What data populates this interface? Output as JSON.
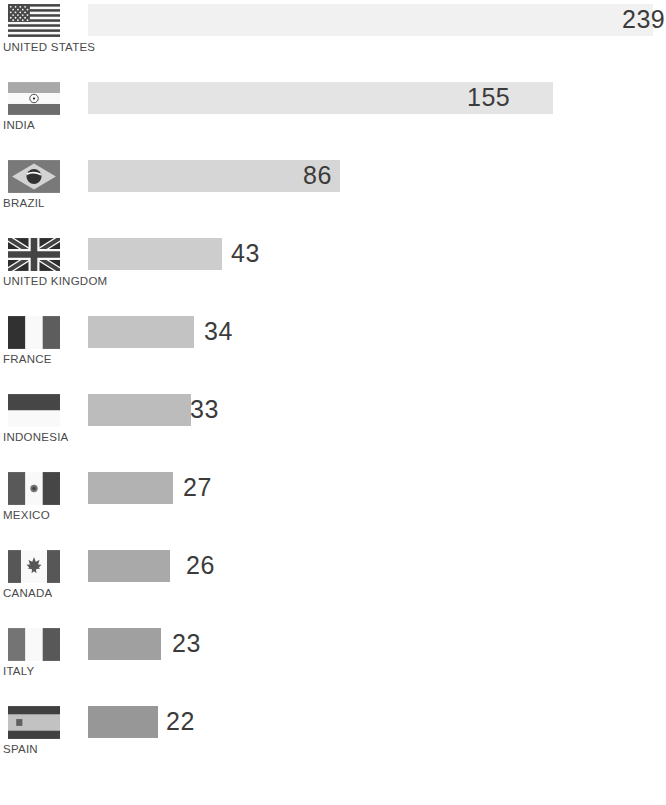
{
  "chart_data": {
    "type": "bar",
    "orientation": "horizontal",
    "title": "",
    "subtitle": "",
    "xlabel": "",
    "ylabel": "",
    "grid": false,
    "legend": false,
    "axis_visible": false,
    "xlim": [
      0,
      239
    ],
    "categories": [
      "UNITED STATES",
      "INDIA",
      "BRAZIL",
      "UNITED KINGDOM",
      "FRANCE",
      "INDONESIA",
      "MEXICO",
      "CANADA",
      "ITALY",
      "SPAIN"
    ],
    "values": [
      239,
      155,
      86,
      43,
      34,
      33,
      27,
      26,
      23,
      22
    ],
    "value_labels": [
      "239",
      "155",
      "86",
      "43",
      "34",
      "33",
      "27",
      "26",
      "23",
      "22"
    ],
    "bar_colors": [
      "#f1f1f1",
      "#e4e4e4",
      "#d6d6d6",
      "#cdcdcd",
      "#c3c3c3",
      "#bcbcbc",
      "#b2b2b2",
      "#a9a9a9",
      "#a0a0a0",
      "#979797"
    ]
  },
  "rows": [
    {
      "country": "UNITED STATES",
      "value": "239",
      "flag_icon": "flag-united-states-icon",
      "bar_width_px": 565,
      "bar_color": "#f1f1f1",
      "label_left_px": 622,
      "row_top_px": 2
    },
    {
      "country": "INDIA",
      "value": "155",
      "flag_icon": "flag-india-icon",
      "bar_width_px": 465,
      "bar_color": "#e4e4e4",
      "label_left_px": 467,
      "row_top_px": 80
    },
    {
      "country": "BRAZIL",
      "value": "86",
      "flag_icon": "flag-brazil-icon",
      "bar_width_px": 252,
      "bar_color": "#d6d6d6",
      "label_left_px": 303,
      "row_top_px": 158
    },
    {
      "country": "UNITED KINGDOM",
      "value": "43",
      "flag_icon": "flag-united-kingdom-icon",
      "bar_width_px": 134,
      "bar_color": "#cdcdcd",
      "label_left_px": 231,
      "row_top_px": 236
    },
    {
      "country": "FRANCE",
      "value": "34",
      "flag_icon": "flag-france-icon",
      "bar_width_px": 106,
      "bar_color": "#c3c3c3",
      "label_left_px": 204,
      "row_top_px": 314
    },
    {
      "country": "INDONESIA",
      "value": "33",
      "flag_icon": "flag-indonesia-icon",
      "bar_width_px": 103,
      "bar_color": "#bcbcbc",
      "label_left_px": 190,
      "row_top_px": 392
    },
    {
      "country": "MEXICO",
      "value": "27",
      "flag_icon": "flag-mexico-icon",
      "bar_width_px": 85,
      "bar_color": "#b2b2b2",
      "label_left_px": 183,
      "row_top_px": 470
    },
    {
      "country": "CANADA",
      "value": "26",
      "flag_icon": "flag-canada-icon",
      "bar_width_px": 82,
      "bar_color": "#a9a9a9",
      "label_left_px": 186,
      "row_top_px": 548
    },
    {
      "country": "ITALY",
      "value": "23",
      "flag_icon": "flag-italy-icon",
      "bar_width_px": 73,
      "bar_color": "#a0a0a0",
      "label_left_px": 172,
      "row_top_px": 626
    },
    {
      "country": "SPAIN",
      "value": "22",
      "flag_icon": "flag-spain-icon",
      "bar_width_px": 70,
      "bar_color": "#979797",
      "label_left_px": 166,
      "row_top_px": 704
    }
  ]
}
